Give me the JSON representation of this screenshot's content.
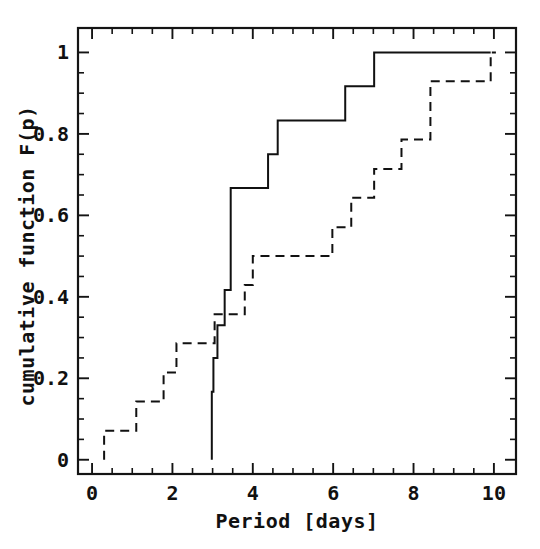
{
  "chart_data": {
    "type": "line",
    "title": "",
    "subtitle": "",
    "xlabel": "Period [days]",
    "ylabel": "cumulative function F(p)",
    "xlim": [
      -0.35,
      10.55
    ],
    "ylim": [
      -0.035,
      1.06
    ],
    "grid": false,
    "legend": null,
    "legend_position": "none",
    "xticks": [
      0,
      2,
      4,
      6,
      8,
      10
    ],
    "xtick_labels": [
      "0",
      "2",
      "4",
      "6",
      "8",
      "10"
    ],
    "xminor_step": 0.5,
    "yticks": [
      0,
      0.2,
      0.4,
      0.6,
      0.8,
      1
    ],
    "ytick_labels": [
      "0",
      "0.2",
      "0.4",
      "0.6",
      "0.8",
      "1"
    ],
    "yminor_step": 0.05,
    "annotations": [],
    "series": [
      {
        "name": "solid cumulative distribution",
        "style": "solid",
        "drawstyle": "steps-post",
        "color": "#111111",
        "x": [
          2.98,
          2.98,
          3.02,
          3.02,
          3.12,
          3.12,
          3.3,
          3.3,
          3.45,
          3.45,
          4.38,
          4.38,
          4.62,
          4.62,
          6.3,
          6.3,
          7.02,
          7.02,
          9.92
        ],
        "y": [
          0.0,
          0.167,
          0.167,
          0.25,
          0.25,
          0.33,
          0.33,
          0.417,
          0.417,
          0.667,
          0.667,
          0.75,
          0.75,
          0.833,
          0.833,
          0.917,
          0.917,
          1.0,
          1.0
        ]
      },
      {
        "name": "dashed cumulative distribution",
        "style": "dashed",
        "drawstyle": "steps-post",
        "color": "#111111",
        "x": [
          0.3,
          0.3,
          1.1,
          1.1,
          1.78,
          1.78,
          2.1,
          2.1,
          3.05,
          3.05,
          3.55,
          3.55,
          3.8,
          3.8,
          4.0,
          4.0,
          5.98,
          5.98,
          6.45,
          6.45,
          7.02,
          7.02,
          7.7,
          7.7,
          8.42,
          8.42,
          9.92,
          9.92,
          10.05
        ],
        "y": [
          0.0,
          0.071,
          0.071,
          0.143,
          0.143,
          0.214,
          0.214,
          0.286,
          0.286,
          0.357,
          0.357,
          0.357,
          0.357,
          0.429,
          0.429,
          0.5,
          0.5,
          0.571,
          0.571,
          0.643,
          0.643,
          0.714,
          0.714,
          0.786,
          0.786,
          0.929,
          0.929,
          1.0,
          1.0
        ]
      }
    ]
  },
  "figure": {
    "background_color": "#ffffff",
    "foreground_color": "#111111"
  }
}
